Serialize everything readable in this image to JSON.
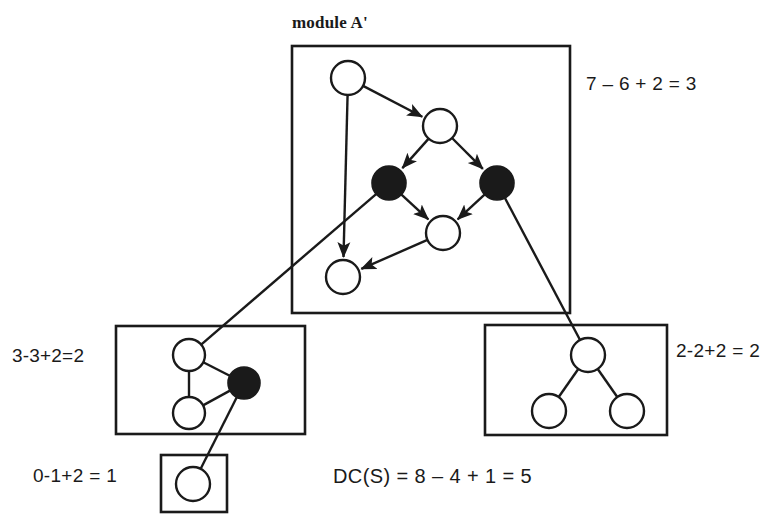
{
  "diagram": {
    "title_label": "module A'",
    "modules": [
      {
        "id": "module-a-prime",
        "name": "module A'",
        "formula": "7 – 6 + 2 = 3",
        "box": {
          "x": 292,
          "y": 46,
          "w": 278,
          "h": 267
        },
        "edge_style": "directed",
        "nodes": [
          {
            "id": "a1",
            "cx": 348,
            "cy": 78,
            "r": 17,
            "fill": "white"
          },
          {
            "id": "a2",
            "cx": 440,
            "cy": 126,
            "r": 17,
            "fill": "white"
          },
          {
            "id": "a3",
            "cx": 389,
            "cy": 183,
            "r": 17,
            "fill": "black"
          },
          {
            "id": "a4",
            "cx": 497,
            "cy": 183,
            "r": 17,
            "fill": "black"
          },
          {
            "id": "a5",
            "cx": 443,
            "cy": 233,
            "r": 17,
            "fill": "white"
          },
          {
            "id": "a6",
            "cx": 343,
            "cy": 277,
            "r": 17,
            "fill": "white"
          }
        ],
        "edges": [
          {
            "from": "a1",
            "to": "a2"
          },
          {
            "from": "a1",
            "to": "a6"
          },
          {
            "from": "a2",
            "to": "a3"
          },
          {
            "from": "a2",
            "to": "a4"
          },
          {
            "from": "a3",
            "to": "a5"
          },
          {
            "from": "a4",
            "to": "a5"
          },
          {
            "from": "a5",
            "to": "a6"
          }
        ]
      },
      {
        "id": "module-left",
        "name": "left module",
        "formula": "3-3+2=2",
        "box": {
          "x": 116,
          "y": 326,
          "w": 189,
          "h": 108
        },
        "edge_style": "undirected",
        "nodes": [
          {
            "id": "b1",
            "cx": 189,
            "cy": 355,
            "r": 16,
            "fill": "white"
          },
          {
            "id": "b2",
            "cx": 189,
            "cy": 413,
            "r": 16,
            "fill": "white"
          },
          {
            "id": "b3",
            "cx": 244,
            "cy": 383,
            "r": 16,
            "fill": "black"
          }
        ],
        "edges": [
          {
            "from": "b1",
            "to": "b2"
          },
          {
            "from": "b1",
            "to": "b3"
          },
          {
            "from": "b2",
            "to": "b3"
          }
        ]
      },
      {
        "id": "module-right",
        "name": "right module",
        "formula": "2-2+2 = 2",
        "box": {
          "x": 485,
          "y": 325,
          "w": 182,
          "h": 110
        },
        "edge_style": "undirected",
        "nodes": [
          {
            "id": "c1",
            "cx": 588,
            "cy": 355,
            "r": 17,
            "fill": "white"
          },
          {
            "id": "c2",
            "cx": 549,
            "cy": 411,
            "r": 17,
            "fill": "white"
          },
          {
            "id": "c3",
            "cx": 627,
            "cy": 411,
            "r": 17,
            "fill": "white"
          }
        ],
        "edges": [
          {
            "from": "c1",
            "to": "c2"
          },
          {
            "from": "c1",
            "to": "c3"
          }
        ]
      },
      {
        "id": "module-small",
        "name": "small module",
        "formula": "0-1+2 = 1",
        "box": {
          "x": 161,
          "y": 455,
          "w": 66,
          "h": 57
        },
        "edge_style": "undirected",
        "nodes": [
          {
            "id": "d1",
            "cx": 193,
            "cy": 484,
            "r": 17,
            "fill": "white"
          }
        ],
        "edges": []
      }
    ],
    "inter_module_edges": [
      {
        "from": "a3",
        "from_module": "module-a-prime",
        "to": "b1",
        "to_module": "module-left"
      },
      {
        "from": "a4",
        "from_module": "module-a-prime",
        "to": "c1",
        "to_module": "module-right"
      },
      {
        "from": "b3",
        "from_module": "module-left",
        "to": "d1",
        "to_module": "module-small"
      }
    ],
    "labels": {
      "title": "module A'",
      "formula_top": "7 – 6 + 2 = 3",
      "formula_left": "3-3+2=2",
      "formula_right": "2-2+2 = 2",
      "formula_small": "0-1+2 = 1",
      "formula_total": "DC(S) = 8 – 4 + 1 = 5"
    },
    "colors": {
      "stroke": "#1a1a1a",
      "node_fill_white": "#ffffff",
      "node_fill_black": "#1a1a1a",
      "background": "#ffffff",
      "text": "#1a1a1a"
    }
  }
}
